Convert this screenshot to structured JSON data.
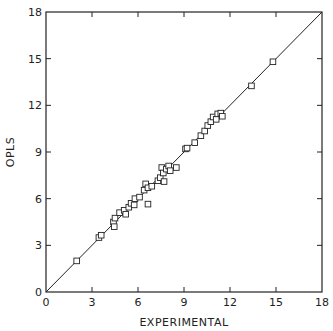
{
  "chart_data": {
    "type": "scatter",
    "title": "",
    "xlabel": "EXPERIMENTAL",
    "ylabel": "OPLS",
    "xlim": [
      0,
      18
    ],
    "ylim": [
      0,
      18
    ],
    "xticks": [
      0,
      3,
      6,
      9,
      12,
      15,
      18
    ],
    "yticks": [
      0,
      3,
      6,
      9,
      12,
      15,
      18
    ],
    "grid": false,
    "legend": null,
    "reference_line": {
      "type": "y=x",
      "from": [
        0,
        0
      ],
      "to": [
        18,
        18
      ]
    },
    "marker": "open-square",
    "series": [
      {
        "name": "OPLS vs experimental",
        "points": [
          [
            2.0,
            2.0
          ],
          [
            3.45,
            3.5
          ],
          [
            3.6,
            3.65
          ],
          [
            4.4,
            4.5
          ],
          [
            4.45,
            4.2
          ],
          [
            4.5,
            4.75
          ],
          [
            4.8,
            5.1
          ],
          [
            5.1,
            5.25
          ],
          [
            5.2,
            5.0
          ],
          [
            5.4,
            5.45
          ],
          [
            5.55,
            5.7
          ],
          [
            5.75,
            5.6
          ],
          [
            5.8,
            6.0
          ],
          [
            6.1,
            6.1
          ],
          [
            6.4,
            6.55
          ],
          [
            6.5,
            6.95
          ],
          [
            6.65,
            6.7
          ],
          [
            6.65,
            5.65
          ],
          [
            6.9,
            6.8
          ],
          [
            7.3,
            7.15
          ],
          [
            7.45,
            7.35
          ],
          [
            7.55,
            8.0
          ],
          [
            7.65,
            7.65
          ],
          [
            7.7,
            7.1
          ],
          [
            7.85,
            7.9
          ],
          [
            8.0,
            8.1
          ],
          [
            8.1,
            7.8
          ],
          [
            8.5,
            8.0
          ],
          [
            9.1,
            9.2
          ],
          [
            9.2,
            9.25
          ],
          [
            9.7,
            9.6
          ],
          [
            10.1,
            10.05
          ],
          [
            10.35,
            10.35
          ],
          [
            10.55,
            10.7
          ],
          [
            10.75,
            10.95
          ],
          [
            10.9,
            11.25
          ],
          [
            11.1,
            11.1
          ],
          [
            11.2,
            11.45
          ],
          [
            11.4,
            11.5
          ],
          [
            11.5,
            11.3
          ],
          [
            13.4,
            13.25
          ],
          [
            14.8,
            14.8
          ]
        ]
      }
    ]
  },
  "colors": {
    "ink": "#222222",
    "background": "#ffffff"
  }
}
